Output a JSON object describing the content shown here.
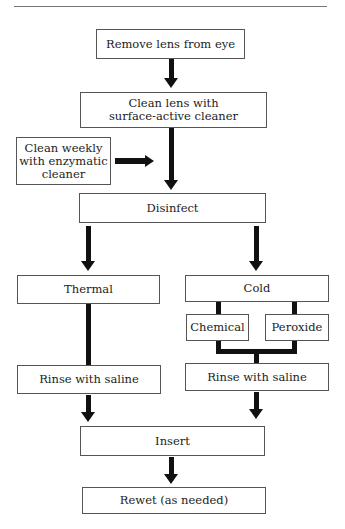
{
  "flowchart": {
    "nodes": {
      "remove": "Remove lens from eye",
      "clean_line1": "Clean lens with",
      "clean_line2": "surface-active cleaner",
      "weekly_line1": "Clean weekly",
      "weekly_line2": "with enzymatic",
      "weekly_line3": "cleaner",
      "disinfect": "Disinfect",
      "thermal": "Thermal",
      "cold": "Cold",
      "chemical": "Chemical",
      "peroxide": "Peroxide",
      "rinse_left": "Rinse with saline",
      "rinse_right": "Rinse with saline",
      "insert": "Insert",
      "rewet": "Rewet (as needed)"
    },
    "edges": [
      [
        "Remove lens from eye",
        "Clean lens with surface-active cleaner"
      ],
      [
        "Clean weekly with enzymatic cleaner",
        "flow to Disinfect"
      ],
      [
        "Clean lens with surface-active cleaner",
        "Disinfect"
      ],
      [
        "Disinfect",
        "Thermal"
      ],
      [
        "Disinfect",
        "Cold"
      ],
      [
        "Cold",
        "Chemical"
      ],
      [
        "Cold",
        "Peroxide"
      ],
      [
        "Chemical",
        "Rinse with saline (right)"
      ],
      [
        "Peroxide",
        "Rinse with saline (right)"
      ],
      [
        "Thermal",
        "Rinse with saline (left)"
      ],
      [
        "Rinse with saline (left)",
        "Insert"
      ],
      [
        "Rinse with saline (right)",
        "Insert"
      ],
      [
        "Insert",
        "Rewet (as needed)"
      ]
    ]
  }
}
